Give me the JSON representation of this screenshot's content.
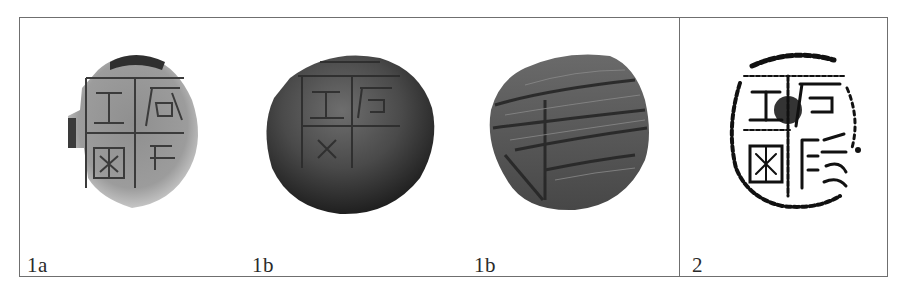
{
  "figure": {
    "panels": [
      {
        "id": "1a",
        "label": "1a",
        "description": "photo of sealing clay impression with seal characters, light grey, broken left edge"
      },
      {
        "id": "1b-front",
        "label": "1b",
        "description": "photo of sealing clay lump, front side with seal impression, dark grey"
      },
      {
        "id": "1b-back",
        "label": "1b",
        "description": "photo of sealing clay lump, reverse side with string/texture marks"
      },
      {
        "id": "2",
        "label": "2",
        "description": "ink rubbing of seal impression, black on white"
      }
    ],
    "colors": {
      "border": "#6f6f6f",
      "label_text": "#2a2a2a",
      "background": "#ffffff"
    }
  }
}
